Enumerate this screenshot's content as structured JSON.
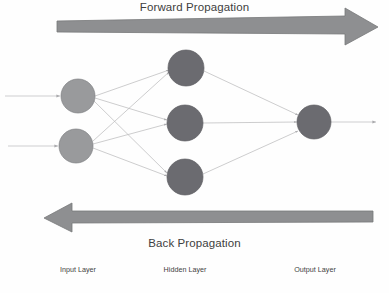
{
  "diagram": {
    "type": "neural-network-architecture",
    "background_color": "#fefefe",
    "forward_label": "Forward Propagation",
    "back_label": "Back Propagation",
    "labels": {
      "input": "Input Layer",
      "hidden": "Hidden Layer",
      "output": "Output Layer"
    },
    "colors": {
      "input_node": "#999a9c",
      "hidden_node": "#6b6b70",
      "output_node": "#6b6b70",
      "node_stroke": "#7e7f82",
      "arrow_band": "#8e8f91",
      "arrow_band_stroke": "#77787a",
      "connection": "#b9b9bb",
      "text": "#404040",
      "label_text": "#3f3f3f"
    },
    "forward_arrow": {
      "direction": "right",
      "shaft_x_start": 57,
      "shaft_x_end": 345,
      "tip_x": 378,
      "center_y": 27
    },
    "back_arrow": {
      "direction": "left",
      "shaft_x_start": 373,
      "shaft_x_end": 72,
      "tip_x": 44,
      "center_y": 217
    },
    "layers": [
      {
        "name": "input",
        "node_count": 2,
        "radius": 17,
        "nodes": [
          {
            "id": "i1",
            "cx": 78,
            "cy": 96
          },
          {
            "id": "i2",
            "cx": 76,
            "cy": 146
          }
        ]
      },
      {
        "name": "hidden",
        "node_count": 3,
        "radius": 18,
        "nodes": [
          {
            "id": "h1",
            "cx": 186,
            "cy": 68
          },
          {
            "id": "h2",
            "cx": 185,
            "cy": 123
          },
          {
            "id": "h3",
            "cx": 185,
            "cy": 177
          }
        ]
      },
      {
        "name": "output",
        "node_count": 1,
        "radius": 17,
        "nodes": [
          {
            "id": "o1",
            "cx": 314,
            "cy": 122
          }
        ]
      }
    ],
    "input_feed_arrows": [
      {
        "x_start": 5,
        "x_end": 60,
        "y": 96
      },
      {
        "x_start": 8,
        "x_end": 58,
        "y": 146
      }
    ],
    "output_feed_arrow": {
      "x_start": 331,
      "x_end": 376,
      "y": 122
    },
    "connections": [
      {
        "from": "i1",
        "to": "h1"
      },
      {
        "from": "i1",
        "to": "h2"
      },
      {
        "from": "i1",
        "to": "h3"
      },
      {
        "from": "i2",
        "to": "h1"
      },
      {
        "from": "i2",
        "to": "h2"
      },
      {
        "from": "i2",
        "to": "h3"
      },
      {
        "from": "h1",
        "to": "o1"
      },
      {
        "from": "h2",
        "to": "o1"
      },
      {
        "from": "h3",
        "to": "o1"
      }
    ]
  }
}
